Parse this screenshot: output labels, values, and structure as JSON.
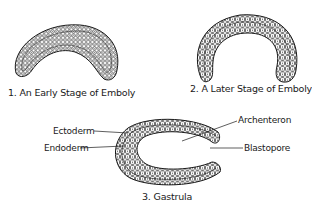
{
  "figures": [
    {
      "id": 1,
      "caption": "1. An Early Stage of Emboly"
    },
    {
      "id": 2,
      "caption": "2. A Later Stage of Emboly"
    },
    {
      "id": 3,
      "caption": "3. Gastrula",
      "labels": {
        "ectoderm": "Ectoderm",
        "endoderm": "Endoderm",
        "archenteron": "Archenteron",
        "blastopore": "Blastopore"
      }
    }
  ],
  "colors": {
    "ink": "#1a1a1a",
    "background": "#ffffff"
  }
}
